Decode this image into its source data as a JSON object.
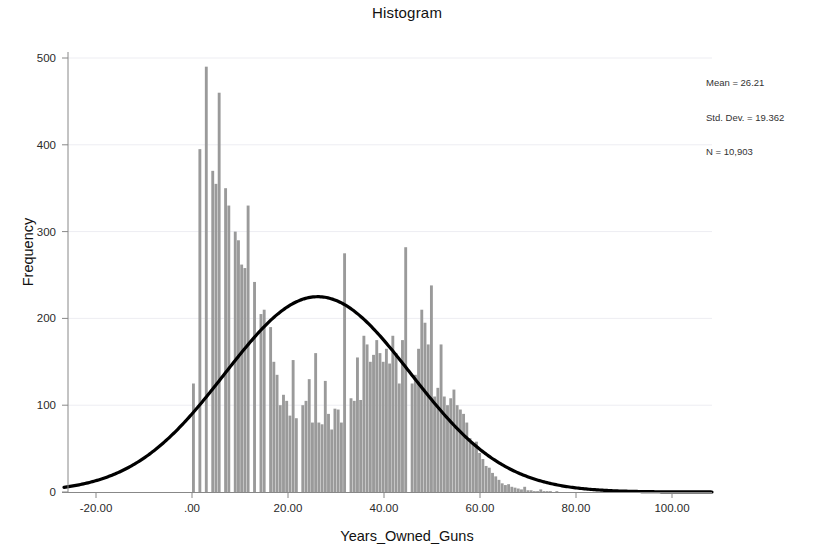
{
  "chart_data": {
    "type": "bar",
    "title": "Histogram",
    "xlabel": "Years_Owned_Guns",
    "ylabel": "Frequency",
    "xlim": [
      -27,
      108
    ],
    "ylim": [
      0,
      520
    ],
    "grid": true,
    "legend": null,
    "xticks": [
      "-20.00",
      ".00",
      "20.00",
      "40.00",
      "60.00",
      "80.00",
      "100.00"
    ],
    "xtick_values": [
      -20,
      0,
      20,
      40,
      60,
      80,
      100
    ],
    "yticks": [
      "0",
      "100",
      "200",
      "300",
      "400",
      "500"
    ],
    "ytick_values": [
      0,
      100,
      200,
      300,
      400,
      500
    ],
    "bin_width": 0.67,
    "bin_start": 0,
    "bar_color": "#9a9a9a",
    "curve_color": "#000000",
    "curve": {
      "type": "normal",
      "mean": 26.21,
      "std_dev": 19.362,
      "n": 10903,
      "peak_value": 225
    },
    "values": [
      125,
      0,
      395,
      0,
      490,
      0,
      370,
      355,
      460,
      0,
      350,
      330,
      0,
      300,
      290,
      262,
      258,
      330,
      0,
      242,
      0,
      205,
      210,
      0,
      190,
      150,
      135,
      100,
      112,
      105,
      88,
      152,
      85,
      0,
      100,
      105,
      130,
      80,
      160,
      80,
      78,
      128,
      90,
      72,
      96,
      95,
      80,
      275,
      0,
      108,
      105,
      155,
      106,
      180,
      170,
      150,
      158,
      175,
      160,
      150,
      165,
      148,
      180,
      160,
      125,
      175,
      282,
      0,
      125,
      135,
      165,
      210,
      195,
      170,
      238,
      110,
      120,
      170,
      110,
      100,
      108,
      118,
      100,
      95,
      90,
      80,
      62,
      55,
      58,
      45,
      38,
      30,
      28,
      22,
      18,
      14,
      10,
      8,
      9,
      6,
      5,
      4,
      3,
      6,
      2,
      2,
      1,
      1,
      3,
      1,
      1,
      1,
      0,
      1
    ]
  },
  "stats": {
    "mean_line": "Mean = 26.21",
    "std_line": "Std. Dev. = 19.362",
    "n_line": "N = 10,903"
  }
}
